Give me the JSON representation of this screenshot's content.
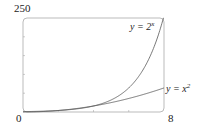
{
  "chart_data": {
    "type": "line",
    "title": "",
    "xlabel": "",
    "ylabel": "",
    "xlim": [
      0,
      8
    ],
    "ylim": [
      0,
      250
    ],
    "grid": false,
    "legend": "none (inline curve labels)",
    "x_tick_labels": [
      "0",
      "8"
    ],
    "y_tick_labels": [
      "250"
    ],
    "minor_ticks_x": [
      2,
      4,
      6
    ],
    "minor_ticks_y": [
      50,
      100,
      150,
      200
    ],
    "series": [
      {
        "name": "y = 2^x",
        "label": "y = 2",
        "label_sup": "x",
        "x": [
          0,
          1,
          2,
          3,
          4,
          5,
          6,
          7,
          8
        ],
        "values": [
          1,
          2,
          4,
          8,
          16,
          32,
          64,
          128,
          256
        ]
      },
      {
        "name": "y = x^2",
        "label": "y = x",
        "label_sup": "2",
        "x": [
          0,
          1,
          2,
          3,
          4,
          5,
          6,
          7,
          8
        ],
        "values": [
          0,
          1,
          4,
          9,
          16,
          25,
          36,
          49,
          64
        ]
      }
    ]
  },
  "labels": {
    "y_max": "250",
    "origin": "0",
    "x_max": "8"
  },
  "colors": {
    "curve": "#555555",
    "frame": "#999999"
  }
}
